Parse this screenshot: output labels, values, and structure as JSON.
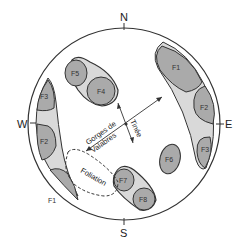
{
  "compass": {
    "north": "N",
    "south": "S",
    "east": "E",
    "west": "W"
  },
  "zones": {
    "northeast": [
      "F1",
      "F2",
      "F3"
    ],
    "west": [
      "F3",
      "F2",
      "F1"
    ],
    "north_center": [
      "F5",
      "F4"
    ],
    "center": [
      "F6"
    ],
    "south": [
      "F7",
      "F8"
    ]
  },
  "labels": {
    "ne_f1": "F1",
    "ne_f2": "F2",
    "ne_f3": "F3",
    "w_f3": "F3",
    "w_f2": "F2",
    "w_f1": "F1",
    "f4": "F4",
    "f5": "F5",
    "f6": "F6",
    "f7": "F7",
    "f8": "F8",
    "gorges_line1": "Gorges de",
    "gorges_line2": "Valabres",
    "tinee": "Tinée",
    "foliation": "Foliation"
  },
  "colors": {
    "dark_fill": "#aaaaaa",
    "light_fill": "#d9d9d9",
    "stroke": "#333333",
    "background": "#ffffff"
  }
}
